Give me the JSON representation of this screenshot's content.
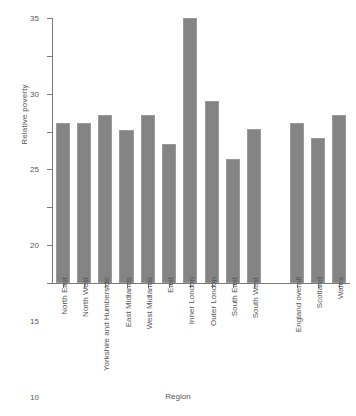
{
  "chart_data": {
    "type": "bar",
    "title": "",
    "xlabel": "Region",
    "ylabel": "Relative poverty",
    "ylim": [
      0,
      35
    ],
    "yticks": [
      0,
      5,
      10,
      15,
      20,
      25,
      30,
      35
    ],
    "grid": false,
    "legend": "none",
    "bar_color": "#848484",
    "categories": [
      "North East",
      "North West",
      "Yorkshire and Humberside",
      "East Midlands",
      "West Midlands",
      "East",
      "Inner London",
      "Outer London",
      "South East",
      "South West",
      "England overall",
      "Scotland",
      "Wales"
    ],
    "values": [
      21.2,
      21.2,
      22.2,
      20.2,
      22.2,
      18.3,
      35.0,
      24.1,
      16.4,
      20.3,
      21.2,
      19.2,
      22.2
    ],
    "groups": [
      {
        "name": "English regions",
        "categories": [
          "North East",
          "North West",
          "Yorkshire and Humberside",
          "East Midlands",
          "West Midlands",
          "East",
          "Inner London",
          "Outer London",
          "South East",
          "South West"
        ]
      },
      {
        "name": "Nations",
        "categories": [
          "England overall",
          "Scotland",
          "Wales"
        ]
      }
    ],
    "group_gap_after_index": 9
  }
}
